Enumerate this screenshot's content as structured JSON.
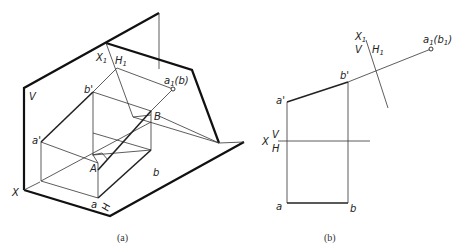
{
  "figure": {
    "header_fragment": "",
    "a": {
      "caption": "(a)",
      "labels": {
        "V": "V",
        "X1": "X",
        "X1_sub": "1",
        "H1": "H",
        "H1_sub": "1",
        "a1b1": "a",
        "a1b1_sub": "1",
        "a1b1_paren": "(b",
        "a1b1_paren_close": ")",
        "b_prime": "b'",
        "a_prime": "a'",
        "B": "B",
        "A": "A",
        "b": "b",
        "a": "a",
        "X": "X",
        "H": "H"
      }
    },
    "b": {
      "caption": "(b)",
      "labels": {
        "X1": "X",
        "X1_sub": "1",
        "V": "V",
        "H1": "H",
        "H1_sub": "1",
        "a1b1": "a",
        "a1b1_sub": "1",
        "a1b1_paren": "(b",
        "a1b1_paren_sub": "1",
        "a1b1_paren_close": ")",
        "b_prime": "b'",
        "a_prime": "a'",
        "X": "X",
        "V_axis": "V",
        "H_axis": "H",
        "a": "a",
        "b": "b"
      }
    }
  }
}
